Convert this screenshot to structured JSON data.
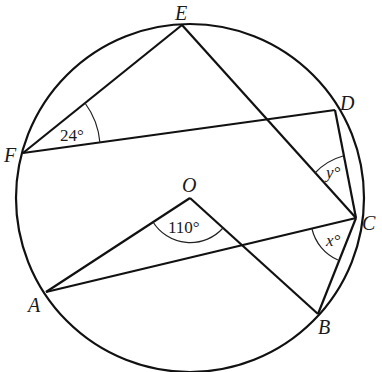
{
  "figure": {
    "type": "circle-geometry",
    "stroke_color": "#111111",
    "circle": {
      "cx": 190,
      "cy": 198,
      "r": 174
    },
    "points": {
      "E": {
        "x": 182,
        "y": 25,
        "label": "E",
        "lx": 175,
        "ly": 20
      },
      "F": {
        "x": 23,
        "y": 153,
        "label": "F",
        "lx": 4,
        "ly": 162
      },
      "D": {
        "x": 335,
        "y": 110,
        "label": "D",
        "lx": 340,
        "ly": 110
      },
      "C": {
        "x": 356,
        "y": 218,
        "label": "C",
        "lx": 362,
        "ly": 230
      },
      "O": {
        "x": 190,
        "y": 198,
        "label": "O",
        "lx": 182,
        "ly": 192
      },
      "A": {
        "x": 46,
        "y": 292,
        "label": "A",
        "lx": 28,
        "ly": 312
      },
      "B": {
        "x": 318,
        "y": 314,
        "label": "B",
        "lx": 318,
        "ly": 334
      }
    },
    "segments": [
      [
        "E",
        "F"
      ],
      [
        "F",
        "D"
      ],
      [
        "E",
        "C"
      ],
      [
        "D",
        "C"
      ],
      [
        "O",
        "A"
      ],
      [
        "O",
        "B"
      ],
      [
        "A",
        "C"
      ],
      [
        "C",
        "B"
      ]
    ],
    "angles": [
      {
        "at": "F",
        "label": "24°",
        "value": 24,
        "text_x": 58,
        "text_y": 140
      },
      {
        "at": "O",
        "label": "110°",
        "value": 110,
        "text_x": 168,
        "text_y": 232
      },
      {
        "at": "C",
        "label": "y°",
        "variable": "y",
        "text_x": 325,
        "text_y": 178
      },
      {
        "at": "C",
        "label": "x°",
        "variable": "x",
        "text_x": 325,
        "text_y": 245
      }
    ]
  }
}
